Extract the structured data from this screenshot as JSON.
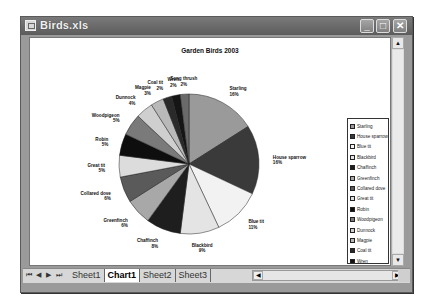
{
  "window": {
    "title": "Birds.xls",
    "minimize_label": "_",
    "maximize_label": "□",
    "close_label": "✕"
  },
  "chart_data": {
    "type": "pie",
    "title": "Garden Birds 2003",
    "categories": [
      "Starling",
      "House sparrow",
      "Blue tit",
      "Blackbird",
      "Chaffinch",
      "Greenfinch",
      "Collared dove",
      "Great tit",
      "Robin",
      "Woodpigeon",
      "Dunnock",
      "Magpie",
      "Coal tit",
      "Wren",
      "Song thrush"
    ],
    "values": [
      16,
      16,
      11,
      9,
      8,
      6,
      6,
      5,
      5,
      5,
      4,
      3,
      2,
      2,
      2
    ],
    "unit": "%",
    "colors": [
      "#9a9a9a",
      "#3a3a3a",
      "#f2f2f2",
      "#e4e4e4",
      "#1e1e1e",
      "#a8a8a8",
      "#5a5a5a",
      "#dcdcdc",
      "#0e0e0e",
      "#7a7a7a",
      "#cfcfcf",
      "#b9b9b9",
      "#2a2a2a",
      "#151515",
      "#6a6a6a"
    ],
    "legend_position": "right",
    "data_labels": true
  },
  "legend": {
    "items": [
      "Starling",
      "House sparrow",
      "Blue tit",
      "Blackbird",
      "Chaffinch",
      "Greenfinch",
      "Collared dove",
      "Great tit",
      "Robin",
      "Woodpigeon",
      "Dunnock",
      "Magpie",
      "Coal tit",
      "Wren",
      "Song thrush"
    ]
  },
  "sheet_tabs": {
    "nav": [
      "⏮",
      "◀",
      "▶",
      "⏭"
    ],
    "tabs": [
      {
        "label": "Sheet1",
        "active": false
      },
      {
        "label": "Chart1",
        "active": true
      },
      {
        "label": "Sheet2",
        "active": false
      },
      {
        "label": "Sheet3",
        "active": false
      }
    ]
  },
  "scroll": {
    "up": "▲",
    "down": "▼",
    "left": "◀",
    "right": "▶"
  }
}
